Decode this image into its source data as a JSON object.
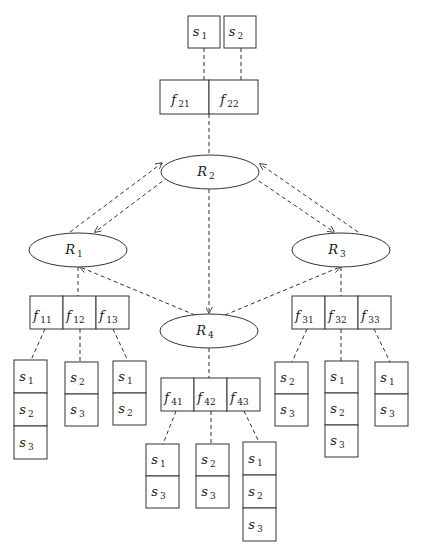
{
  "diagram": {
    "title": "",
    "sources_top": [
      {
        "id": "s1_top",
        "label": "s",
        "sub": "1",
        "x": 188,
        "y": 16,
        "w": 32,
        "h": 32
      },
      {
        "id": "s2_top",
        "label": "s",
        "sub": "2",
        "x": 224,
        "y": 16,
        "w": 32,
        "h": 32
      }
    ],
    "relations": [
      {
        "id": "R2",
        "label": "R",
        "sub": "2",
        "cx": 210,
        "cy": 172,
        "rx": 49,
        "ry": 17
      },
      {
        "id": "R1",
        "label": "R",
        "sub": "1",
        "cx": 78,
        "cy": 250,
        "rx": 49,
        "ry": 17
      },
      {
        "id": "R3",
        "label": "R",
        "sub": "3",
        "cx": 341,
        "cy": 250,
        "rx": 49,
        "ry": 17
      },
      {
        "id": "R4",
        "label": "R",
        "sub": "4",
        "cx": 209,
        "cy": 331,
        "rx": 49,
        "ry": 17
      }
    ],
    "fragment_rows": [
      {
        "id": "F2",
        "x": 160,
        "y": 80,
        "cellW": 49,
        "h": 34,
        "cells": [
          {
            "label": "f",
            "sub": "21"
          },
          {
            "label": "f",
            "sub": "22"
          }
        ]
      },
      {
        "id": "F1",
        "x": 30,
        "y": 296,
        "cellW": 33,
        "h": 33,
        "cells": [
          {
            "label": "f",
            "sub": "11"
          },
          {
            "label": "f",
            "sub": "12"
          },
          {
            "label": "f",
            "sub": "13"
          }
        ]
      },
      {
        "id": "F3",
        "x": 292,
        "y": 296,
        "cellW": 33,
        "h": 33,
        "cells": [
          {
            "label": "f",
            "sub": "31"
          },
          {
            "label": "f",
            "sub": "32"
          },
          {
            "label": "f",
            "sub": "33"
          }
        ]
      },
      {
        "id": "F4",
        "x": 161,
        "y": 378,
        "cellW": 33,
        "h": 33,
        "cells": [
          {
            "label": "f",
            "sub": "41"
          },
          {
            "label": "f",
            "sub": "42"
          },
          {
            "label": "f",
            "sub": "43"
          }
        ]
      }
    ],
    "site_stacks": [
      {
        "id": "f11_sites",
        "x": 14,
        "y": 360,
        "w": 33,
        "cellH": 33,
        "cells": [
          "1",
          "2",
          "3"
        ]
      },
      {
        "id": "f12_sites",
        "x": 65,
        "y": 362,
        "w": 33,
        "cellH": 32,
        "cells": [
          "2",
          "3"
        ]
      },
      {
        "id": "f13_sites",
        "x": 113,
        "y": 361,
        "w": 33,
        "cellH": 32,
        "cells": [
          "1",
          "2"
        ]
      },
      {
        "id": "f31_sites",
        "x": 275,
        "y": 362,
        "w": 33,
        "cellH": 32,
        "cells": [
          "2",
          "3"
        ]
      },
      {
        "id": "f32_sites",
        "x": 325,
        "y": 361,
        "w": 33,
        "cellH": 32,
        "cells": [
          "1",
          "2",
          "3"
        ]
      },
      {
        "id": "f33_sites",
        "x": 375,
        "y": 362,
        "w": 33,
        "cellH": 32,
        "cells": [
          "1",
          "3"
        ]
      },
      {
        "id": "f41_sites",
        "x": 146,
        "y": 444,
        "w": 33,
        "cellH": 32,
        "cells": [
          "1",
          "3"
        ]
      },
      {
        "id": "f42_sites",
        "x": 196,
        "y": 444,
        "w": 33,
        "cellH": 32,
        "cells": [
          "2",
          "3"
        ]
      },
      {
        "id": "f43_sites",
        "x": 243,
        "y": 442,
        "w": 33,
        "cellH": 33,
        "cells": [
          "1",
          "2",
          "3"
        ]
      }
    ],
    "edges": [
      {
        "from": [
          204,
          48
        ],
        "to": [
          204,
          80
        ],
        "arrow": false
      },
      {
        "from": [
          241,
          48
        ],
        "to": [
          241,
          80
        ],
        "arrow": false
      },
      {
        "from": [
          209,
          114
        ],
        "to": [
          209,
          155
        ],
        "arrow": false
      },
      {
        "from": [
          70,
          232
        ],
        "to": [
          162,
          163
        ],
        "arrow": true
      },
      {
        "from": [
          168,
          177
        ],
        "to": [
          95,
          232
        ],
        "arrow": true
      },
      {
        "from": [
          253,
          177
        ],
        "to": [
          334,
          232
        ],
        "arrow": true
      },
      {
        "from": [
          358,
          232
        ],
        "to": [
          260,
          164
        ],
        "arrow": true
      },
      {
        "from": [
          209,
          189
        ],
        "to": [
          209,
          313
        ],
        "arrow": true
      },
      {
        "from": [
          195,
          315
        ],
        "to": [
          80,
          267
        ],
        "arrow": true
      },
      {
        "from": [
          225,
          315
        ],
        "to": [
          340,
          267
        ],
        "arrow": true
      },
      {
        "from": [
          78,
          267
        ],
        "to": [
          78,
          296
        ],
        "arrow": false
      },
      {
        "from": [
          341,
          267
        ],
        "to": [
          341,
          296
        ],
        "arrow": false
      },
      {
        "from": [
          209,
          348
        ],
        "to": [
          209,
          378
        ],
        "arrow": false
      },
      {
        "from": [
          45,
          329
        ],
        "to": [
          31,
          360
        ],
        "arrow": false
      },
      {
        "from": [
          80,
          329
        ],
        "to": [
          80,
          362
        ],
        "arrow": false
      },
      {
        "from": [
          113,
          329
        ],
        "to": [
          128,
          361
        ],
        "arrow": false
      },
      {
        "from": [
          307,
          329
        ],
        "to": [
          292,
          362
        ],
        "arrow": false
      },
      {
        "from": [
          341,
          329
        ],
        "to": [
          341,
          361
        ],
        "arrow": false
      },
      {
        "from": [
          374,
          329
        ],
        "to": [
          390,
          362
        ],
        "arrow": false
      },
      {
        "from": [
          176,
          411
        ],
        "to": [
          163,
          444
        ],
        "arrow": false
      },
      {
        "from": [
          211,
          411
        ],
        "to": [
          211,
          444
        ],
        "arrow": false
      },
      {
        "from": [
          244,
          411
        ],
        "to": [
          259,
          442
        ],
        "arrow": false
      }
    ]
  }
}
